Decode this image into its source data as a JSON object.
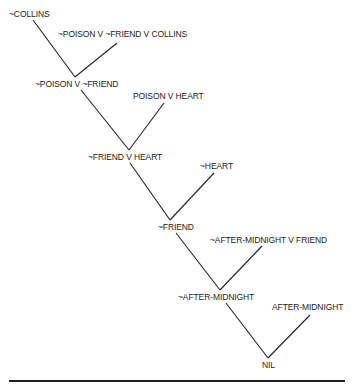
{
  "diagram": {
    "type": "resolution-refutation-tree",
    "nodes": {
      "n1": "~COLLINS",
      "n2": "~POISON V ~FRIEND V COLLINS",
      "n3": "~POISON V ~FRIEND",
      "n4": "POISON V HEART",
      "n5": "~FRIEND V HEART",
      "n6": "~HEART",
      "n7": "~FRIEND",
      "n8": "~AFTER-MIDNIGHT V FRIEND",
      "n9": "~AFTER-MIDNIGHT",
      "n10": "AFTER-MIDNIGHT",
      "n11": "NIL"
    },
    "edges": [
      [
        "n1",
        "n3"
      ],
      [
        "n2",
        "n3"
      ],
      [
        "n3",
        "n5"
      ],
      [
        "n4",
        "n5"
      ],
      [
        "n5",
        "n7"
      ],
      [
        "n6",
        "n7"
      ],
      [
        "n7",
        "n9"
      ],
      [
        "n8",
        "n9"
      ],
      [
        "n9",
        "n11"
      ],
      [
        "n10",
        "n11"
      ]
    ],
    "colors": {
      "ink": "#222222",
      "background": "#ffffff"
    }
  }
}
